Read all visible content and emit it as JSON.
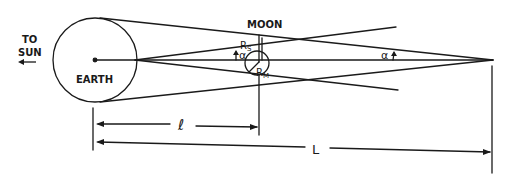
{
  "diagram": {
    "labels": {
      "to_sun_line1": "TO",
      "to_sun_line2": "SUN",
      "to_sun_arrow": "←",
      "earth": "EARTH",
      "moon": "MOON",
      "r_s": "R",
      "r_s_sub": "S",
      "r_m": "R",
      "r_m_sub": "M",
      "alpha_near_moon": "α",
      "alpha_near_apex": "α",
      "small_l": "ℓ",
      "big_l": "L"
    },
    "colors": {
      "ink": "#1a1a1a",
      "background": "#ffffff"
    }
  }
}
